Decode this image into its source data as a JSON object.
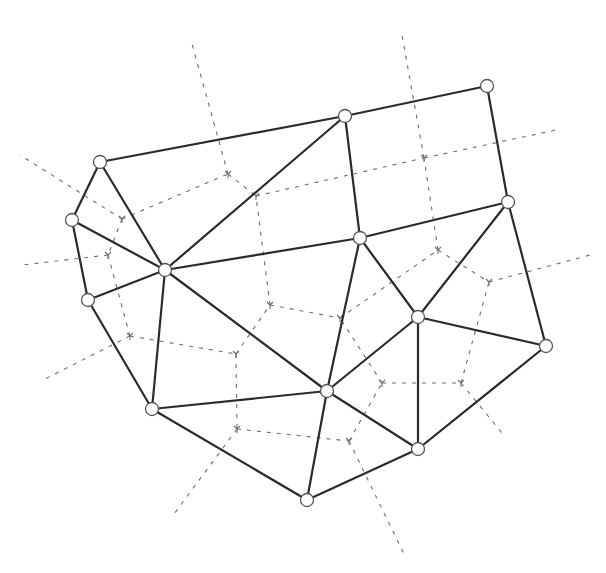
{
  "diagram": {
    "colors": {
      "edge": "#2b2b2b",
      "voronoi": "#6e6e6e",
      "node_fill": "#ffffff",
      "node_stroke": "#555555",
      "background": "#ffffff"
    },
    "node_radius": 6.5,
    "nodes": [
      {
        "id": "A",
        "x": 100,
        "y": 162
      },
      {
        "id": "B",
        "x": 72,
        "y": 220
      },
      {
        "id": "C",
        "x": 88,
        "y": 300
      },
      {
        "id": "D",
        "x": 165,
        "y": 270
      },
      {
        "id": "E",
        "x": 152,
        "y": 409
      },
      {
        "id": "F",
        "x": 345,
        "y": 116
      },
      {
        "id": "G",
        "x": 487,
        "y": 86
      },
      {
        "id": "H",
        "x": 508,
        "y": 202
      },
      {
        "id": "I",
        "x": 360,
        "y": 238
      },
      {
        "id": "J",
        "x": 418,
        "y": 317
      },
      {
        "id": "K",
        "x": 546,
        "y": 346
      },
      {
        "id": "L",
        "x": 327,
        "y": 391
      },
      {
        "id": "M",
        "x": 418,
        "y": 449
      },
      {
        "id": "N",
        "x": 307,
        "y": 500
      }
    ],
    "edges": [
      [
        "A",
        "F"
      ],
      [
        "F",
        "G"
      ],
      [
        "G",
        "H"
      ],
      [
        "A",
        "B"
      ],
      [
        "B",
        "C"
      ],
      [
        "A",
        "D"
      ],
      [
        "B",
        "D"
      ],
      [
        "C",
        "D"
      ],
      [
        "C",
        "E"
      ],
      [
        "D",
        "F"
      ],
      [
        "D",
        "I"
      ],
      [
        "F",
        "I"
      ],
      [
        "I",
        "H"
      ],
      [
        "H",
        "J"
      ],
      [
        "I",
        "J"
      ],
      [
        "I",
        "L"
      ],
      [
        "D",
        "L"
      ],
      [
        "D",
        "E"
      ],
      [
        "E",
        "L"
      ],
      [
        "E",
        "N"
      ],
      [
        "L",
        "N"
      ],
      [
        "L",
        "J"
      ],
      [
        "J",
        "M"
      ],
      [
        "J",
        "K"
      ],
      [
        "H",
        "K"
      ],
      [
        "K",
        "M"
      ],
      [
        "M",
        "N"
      ],
      [
        "L",
        "M"
      ]
    ],
    "voronoi_vertices": [
      {
        "id": "v1",
        "x": 122,
        "y": 219
      },
      {
        "id": "v2",
        "x": 108,
        "y": 255
      },
      {
        "id": "v3",
        "x": 228,
        "y": 174
      },
      {
        "id": "v4",
        "x": 256,
        "y": 196
      },
      {
        "id": "v5",
        "x": 424,
        "y": 158
      },
      {
        "id": "v6",
        "x": 130,
        "y": 336
      },
      {
        "id": "v7",
        "x": 236,
        "y": 354
      },
      {
        "id": "v8",
        "x": 270,
        "y": 305
      },
      {
        "id": "v9",
        "x": 340,
        "y": 318
      },
      {
        "id": "v10",
        "x": 438,
        "y": 250
      },
      {
        "id": "v11",
        "x": 489,
        "y": 282
      },
      {
        "id": "v12",
        "x": 237,
        "y": 429
      },
      {
        "id": "v13",
        "x": 349,
        "y": 441
      },
      {
        "id": "v14",
        "x": 382,
        "y": 383
      },
      {
        "id": "v15",
        "x": 461,
        "y": 383
      }
    ],
    "voronoi_segments": [
      [
        "v1",
        "v2"
      ],
      [
        "v1",
        "v3"
      ],
      [
        "v3",
        "v4"
      ],
      [
        "v4",
        "v5"
      ],
      [
        "v2",
        "v6"
      ],
      [
        "v6",
        "v7"
      ],
      [
        "v7",
        "v8"
      ],
      [
        "v8",
        "v4"
      ],
      [
        "v8",
        "v9"
      ],
      [
        "v9",
        "v10"
      ],
      [
        "v10",
        "v5"
      ],
      [
        "v10",
        "v11"
      ],
      [
        "v7",
        "v12"
      ],
      [
        "v12",
        "v13"
      ],
      [
        "v13",
        "v14"
      ],
      [
        "v14",
        "v9"
      ],
      [
        "v14",
        "v15"
      ],
      [
        "v15",
        "v11"
      ]
    ],
    "voronoi_rays": [
      {
        "from": "v1",
        "to": [
          20,
          155
        ]
      },
      {
        "from": "v2",
        "to": [
          22,
          265
        ]
      },
      {
        "from": "v3",
        "to": [
          192,
          44
        ]
      },
      {
        "from": "v5",
        "to": [
          402,
          35
        ]
      },
      {
        "from": "v5",
        "to": [
          556,
          130
        ]
      },
      {
        "from": "v11",
        "to": [
          590,
          255
        ]
      },
      {
        "from": "v15",
        "to": [
          502,
          433
        ]
      },
      {
        "from": "v13",
        "to": [
          404,
          554
        ]
      },
      {
        "from": "v12",
        "to": [
          174,
          514
        ]
      },
      {
        "from": "v6",
        "to": [
          43,
          380
        ]
      }
    ]
  }
}
